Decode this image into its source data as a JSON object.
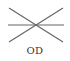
{
  "symbol": {
    "name": "outside-diameter-symbol",
    "stroke_color": "#666666",
    "lines": [
      {
        "x1": 9,
        "y1": 8,
        "x2": 63,
        "y2": 42
      },
      {
        "x1": 63,
        "y1": 8,
        "x2": 9,
        "y2": 42
      },
      {
        "x1": 8,
        "y1": 25,
        "x2": 64,
        "y2": 25
      }
    ]
  },
  "label": "OD"
}
